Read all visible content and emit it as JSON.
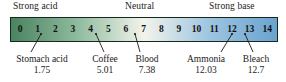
{
  "figure": {
    "categories": [
      {
        "id": "strong-acid",
        "label": "Strong acid"
      },
      {
        "id": "neutral",
        "label": "Neutral"
      },
      {
        "id": "strong-base",
        "label": "Strong base"
      }
    ],
    "scale": {
      "min": 0,
      "max": 14,
      "ticks": [
        "0",
        "1",
        "2",
        "3",
        "4",
        "5",
        "6",
        "7",
        "8",
        "9",
        "10",
        "11",
        "12",
        "13",
        "14"
      ],
      "gradient_stops": [
        "#4a8360",
        "#8fbb9e",
        "#f3f3ec",
        "#9cc4e0",
        "#6ba3cf"
      ],
      "border_color": "#15291c"
    },
    "callouts": [
      {
        "id": "stomach-acid",
        "name": "Stomach acid",
        "value": "1.75",
        "ph": 1.75
      },
      {
        "id": "coffee",
        "name": "Coffee",
        "value": "5.01",
        "ph": 5.01
      },
      {
        "id": "blood",
        "name": "Blood",
        "value": "7.38",
        "ph": 7.38
      },
      {
        "id": "ammonia",
        "name": "Ammonia",
        "value": "12.03",
        "ph": 12.03
      },
      {
        "id": "bleach",
        "name": "Bleach",
        "value": "12.7",
        "ph": 12.7
      }
    ]
  },
  "chart_data": {
    "type": "bar",
    "xlabel": "pH",
    "ylabel": "",
    "xlim": [
      0,
      14
    ],
    "grid": false,
    "legend": "none",
    "categories": [
      "0",
      "1",
      "2",
      "3",
      "4",
      "5",
      "6",
      "7",
      "8",
      "9",
      "10",
      "11",
      "12",
      "13",
      "14"
    ],
    "values": [
      0,
      1,
      2,
      3,
      4,
      5,
      6,
      7,
      8,
      9,
      10,
      11,
      12,
      13,
      14
    ],
    "annotations": [
      {
        "label": "Strong acid",
        "position": "left-top"
      },
      {
        "label": "Neutral",
        "position": "center-top"
      },
      {
        "label": "Strong base",
        "position": "right-top"
      },
      {
        "label": "Stomach acid",
        "value": 1.75,
        "position": "bottom"
      },
      {
        "label": "Coffee",
        "value": 5.01,
        "position": "bottom"
      },
      {
        "label": "Blood",
        "value": 7.38,
        "position": "bottom"
      },
      {
        "label": "Ammonia",
        "value": 12.03,
        "position": "bottom"
      },
      {
        "label": "Bleach",
        "value": 12.7,
        "position": "bottom"
      }
    ]
  }
}
